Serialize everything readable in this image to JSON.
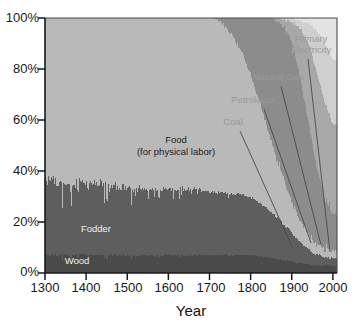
{
  "chart_data": {
    "type": "area",
    "title": "",
    "subtitle": "",
    "xlabel": "Year",
    "ylabel": "",
    "xlim": [
      1300,
      2010
    ],
    "ylim": [
      0,
      100
    ],
    "grid": false,
    "legend_position": "inline-annotations",
    "stacked": true,
    "normalized_percent": true,
    "x_ticks": [
      1300,
      1400,
      1500,
      1600,
      1700,
      1800,
      1900,
      2000
    ],
    "x_tick_labels": [
      "1300",
      "1400",
      "1500",
      "1600",
      "1700",
      "1800",
      "1900",
      "2000"
    ],
    "y_ticks": [
      0,
      20,
      40,
      60,
      80,
      100
    ],
    "y_tick_labels": [
      "0%",
      "20%",
      "40%",
      "60%",
      "80%",
      "100%"
    ],
    "x": [
      1300,
      1310,
      1320,
      1330,
      1340,
      1350,
      1360,
      1370,
      1380,
      1390,
      1400,
      1410,
      1420,
      1430,
      1440,
      1450,
      1460,
      1470,
      1480,
      1490,
      1500,
      1510,
      1520,
      1530,
      1540,
      1550,
      1560,
      1570,
      1580,
      1590,
      1600,
      1610,
      1620,
      1630,
      1640,
      1650,
      1660,
      1670,
      1680,
      1690,
      1700,
      1710,
      1720,
      1730,
      1740,
      1750,
      1760,
      1770,
      1780,
      1790,
      1800,
      1810,
      1820,
      1830,
      1840,
      1850,
      1860,
      1870,
      1880,
      1890,
      1900,
      1910,
      1920,
      1930,
      1940,
      1950,
      1960,
      1970,
      1980,
      1990,
      2000
    ],
    "series": [
      {
        "name": "Wood",
        "color": "#4a4a4a",
        "label_visible": "Wood",
        "values": [
          7,
          7,
          7,
          7,
          7,
          7,
          7,
          7,
          7,
          7,
          7,
          7,
          7,
          7,
          7,
          7,
          7,
          7,
          7,
          7,
          7,
          7,
          7,
          7,
          7,
          7,
          7,
          7,
          7,
          7,
          7,
          7,
          7,
          7,
          7,
          7,
          7,
          7,
          7,
          7,
          7,
          7,
          7,
          7,
          7,
          7,
          7,
          7,
          7,
          7,
          7,
          7,
          6.5,
          6.5,
          6,
          6,
          5.5,
          5.5,
          5,
          5,
          4.5,
          4,
          4,
          3.5,
          3.5,
          3,
          3,
          3,
          3,
          3,
          3
        ]
      },
      {
        "name": "Fodder",
        "color": "#5e5e5e",
        "label_visible": "Fodder",
        "values": [
          29,
          29,
          29,
          29,
          29,
          28,
          28,
          28,
          28,
          28,
          28,
          28,
          28,
          28,
          28,
          28,
          27,
          27,
          27,
          27,
          27,
          27,
          27,
          27,
          26,
          26,
          26,
          26,
          26,
          26,
          26,
          26,
          26,
          26,
          26,
          26,
          26,
          26,
          25,
          25,
          25,
          25,
          25,
          25,
          24,
          24,
          24,
          24,
          24,
          23,
          23,
          22,
          21,
          20,
          19,
          18,
          17,
          16,
          14,
          13,
          11,
          10,
          8,
          7,
          6,
          5,
          4,
          4,
          3,
          3,
          3
        ]
      },
      {
        "name": "Food (for physical labor)",
        "color": "#b9b9b9",
        "label_visible": "Food\n(for physical labor)",
        "values": [
          64,
          64,
          64,
          64,
          64,
          65,
          65,
          65,
          65,
          65,
          65,
          65,
          65,
          65,
          65,
          65,
          66,
          66,
          66,
          66,
          66,
          66,
          66,
          66,
          67,
          67,
          67,
          67,
          67,
          67,
          67,
          67,
          67,
          67,
          67,
          67,
          67,
          67,
          68,
          68,
          68,
          68,
          67,
          66,
          65,
          63,
          61,
          58,
          55,
          52,
          48,
          44,
          40,
          36,
          32,
          28,
          24,
          21,
          18,
          15,
          12,
          10,
          8,
          7,
          6,
          5,
          4,
          4,
          3,
          3,
          3
        ]
      },
      {
        "name": "Coal",
        "color": "#8c8c8c",
        "label_visible": "Coal",
        "values": [
          0,
          0,
          0,
          0,
          0,
          0,
          0,
          0,
          0,
          0,
          0,
          0,
          0,
          0,
          0,
          0,
          0,
          0,
          0,
          0,
          0,
          0,
          0,
          0,
          0,
          0,
          0,
          0,
          0,
          0,
          0,
          0,
          0,
          0,
          0,
          0,
          0,
          0,
          0,
          0,
          0,
          0,
          1,
          2,
          4,
          6,
          8,
          11,
          14,
          18,
          22,
          27,
          32,
          37,
          43,
          48,
          53,
          57,
          60,
          62,
          62,
          60,
          56,
          50,
          44,
          38,
          31,
          25,
          20,
          17,
          15
        ]
      },
      {
        "name": "Petroleum",
        "color": "#a8a8a8",
        "label_visible": "Petroleum",
        "values": [
          0,
          0,
          0,
          0,
          0,
          0,
          0,
          0,
          0,
          0,
          0,
          0,
          0,
          0,
          0,
          0,
          0,
          0,
          0,
          0,
          0,
          0,
          0,
          0,
          0,
          0,
          0,
          0,
          0,
          0,
          0,
          0,
          0,
          0,
          0,
          0,
          0,
          0,
          0,
          0,
          0,
          0,
          0,
          0,
          0,
          0,
          0,
          0,
          0,
          0,
          0,
          0,
          0,
          0,
          0,
          0,
          1,
          2,
          3,
          5,
          8,
          13,
          19,
          25,
          30,
          34,
          37,
          38,
          38,
          37,
          36
        ]
      },
      {
        "name": "Natural Gas",
        "color": "#cfcfcf",
        "label_visible": "Natural Gas",
        "values": [
          0,
          0,
          0,
          0,
          0,
          0,
          0,
          0,
          0,
          0,
          0,
          0,
          0,
          0,
          0,
          0,
          0,
          0,
          0,
          0,
          0,
          0,
          0,
          0,
          0,
          0,
          0,
          0,
          0,
          0,
          0,
          0,
          0,
          0,
          0,
          0,
          0,
          0,
          0,
          0,
          0,
          0,
          0,
          0,
          0,
          0,
          0,
          0,
          0,
          0,
          0,
          0,
          0,
          0,
          0,
          0,
          0,
          0,
          1,
          1,
          2,
          2,
          3,
          5,
          8,
          12,
          16,
          20,
          23,
          25,
          26
        ]
      },
      {
        "name": "Primary Electricity",
        "color": "#e3e3e3",
        "label_visible": "Primary Electricity",
        "values": [
          0,
          0,
          0,
          0,
          0,
          0,
          0,
          0,
          0,
          0,
          0,
          0,
          0,
          0,
          0,
          0,
          0,
          0,
          0,
          0,
          0,
          0,
          0,
          0,
          0,
          0,
          0,
          0,
          0,
          0,
          0,
          0,
          0,
          0,
          0,
          0,
          0,
          0,
          0,
          0,
          0,
          0,
          0,
          0,
          0,
          0,
          0,
          0,
          0,
          0,
          0,
          0,
          0,
          0,
          0,
          0,
          0,
          0,
          0,
          0,
          0,
          1,
          1,
          2,
          2,
          3,
          5,
          7,
          10,
          13,
          17
        ]
      }
    ],
    "annotations": [
      {
        "text": "Coal",
        "style": "callout"
      },
      {
        "text": "Petroleum",
        "style": "callout"
      },
      {
        "text": "Natural Gas",
        "style": "callout"
      },
      {
        "text": "Primary",
        "style": "callout"
      },
      {
        "text": "Electricity",
        "style": "callout"
      },
      {
        "text": "Food",
        "style": "inline-dark"
      },
      {
        "text": "(for physical labor)",
        "style": "inline-dark"
      },
      {
        "text": "Fodder",
        "style": "inline-light"
      },
      {
        "text": "Wood",
        "style": "inline-light"
      }
    ],
    "colors": {
      "wood": "#4a4a4a",
      "fodder": "#5e5e5e",
      "food": "#b9b9b9",
      "coal": "#8c8c8c",
      "petroleum": "#a8a8a8",
      "natural_gas": "#cfcfcf",
      "primary_electricity": "#e3e3e3",
      "axis": "#1a1a1a",
      "background": "#ffffff",
      "callout_text": "#9a9a9a"
    }
  },
  "axes": {
    "y_labels": [
      "100%",
      "80%",
      "60%",
      "40%",
      "20%",
      "0%"
    ],
    "x_labels": [
      "1300",
      "1400",
      "1500",
      "1600",
      "1700",
      "1800",
      "1900",
      "2000"
    ],
    "x_title": "Year"
  },
  "labels": {
    "wood": "Wood",
    "fodder": "Fodder",
    "food_line1": "Food",
    "food_line2": "(for physical labor)",
    "coal": "Coal",
    "petroleum": "Petroleum",
    "natural_gas": "Natural Gas",
    "primary_line1": "Primary",
    "primary_line2": "Electricity"
  }
}
